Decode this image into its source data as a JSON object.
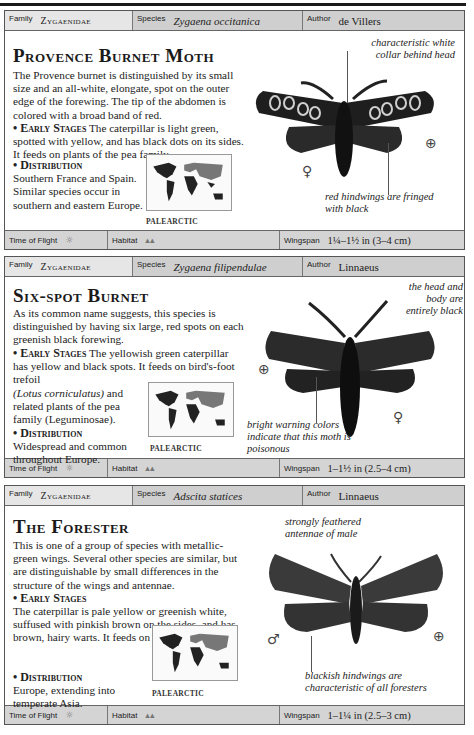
{
  "entries": [
    {
      "family_label": "Family",
      "family": "Zygaenidae",
      "species_label": "Species",
      "species": "Zygaena occitanica",
      "author_label": "Author",
      "author": "de Villers",
      "title": "Provence Burnet Moth",
      "description": "The Provence burnet is distinguished by its small size and an all-white, elongate, spot on the outer edge of the forewing. The tip of the abdomen is colored with a broad band of red.",
      "early_stages_heading": "• Early Stages",
      "early_stages": "The caterpillar is light green, spotted with yellow, and has black dots on its sides. It feeds on plants of the pea family.",
      "distribution_heading": "• Distribution",
      "distribution": "Southern France and Spain. Similar species occur in southern and eastern Europe.",
      "map_label": "PALEARCTIC",
      "annotation_1": "characteristic white collar behind head",
      "annotation_2": "red hindwings are fringed with black",
      "sex_symbol": "♀",
      "magnify_icon": "magnify-icon",
      "time_label": "Time of Flight",
      "time_icon": "☼",
      "habitat_label": "Habitat",
      "habitat_icon": "ᨓᨓ",
      "wingspan_label": "Wingspan",
      "wingspan": "1¼–1½ in (3–4 cm)"
    },
    {
      "family_label": "Family",
      "family": "Zygaenidae",
      "species_label": "Species",
      "species": "Zygaena filipendulae",
      "author_label": "Author",
      "author": "Linnaeus",
      "title": "Six-spot Burnet",
      "description": "As its common name suggests, this species is distinguished by having six large, red spots on each greenish black forewing.",
      "early_stages_heading": "• Early Stages",
      "early_stages_a": "The yellowish green caterpillar has yellow and black spots. It feeds on bird's-foot trefoil",
      "early_stages_italic": "(Lotus corniculatus)",
      "early_stages_b": "and related plants of the pea family (Leguminosae).",
      "distribution_heading": "• Distribution",
      "distribution": "Widespread and common throughout Europe.",
      "map_label": "PALEARCTIC",
      "annotation_1": "the head and body are entirely black",
      "annotation_2": "bright warning colors indicate that this moth is poisonous",
      "sex_symbol": "♀",
      "time_label": "Time of Flight",
      "time_icon": "☼",
      "habitat_label": "Habitat",
      "habitat_icon": "ᨓᨓ",
      "wingspan_label": "Wingspan",
      "wingspan": "1–1½ in (2.5–4 cm)"
    },
    {
      "family_label": "Family",
      "family": "Zygaenidae",
      "species_label": "Species",
      "species": "Adscita statices",
      "author_label": "Author",
      "author": "Linnaeus",
      "title": "The Forester",
      "description": "This is one of a group of species with metallic-green wings. Several other species are similar, but are distinguishable by small differences in the structure of the wings and antennae.",
      "early_stages_heading": "• Early Stages",
      "early_stages_a": "The caterpillar is pale yellow or greenish white, suffused with pinkish brown on the sides, and has brown, hairy warts. It feeds on sorrel",
      "early_stages_italic": "(Rumex).",
      "distribution_heading": "• Distribution",
      "distribution": "Europe, extending into temperate Asia.",
      "map_label": "PALEARCTIC",
      "annotation_1": "strongly feathered antennae of male",
      "annotation_2": "blackish hindwings are characteristic of all foresters",
      "sex_symbol": "♂",
      "time_label": "Time of Flight",
      "time_icon": "☼",
      "habitat_label": "Habitat",
      "habitat_icon": "ᨓᨓ",
      "wingspan_label": "Wingspan",
      "wingspan": "1–1¼ in (2.5–3 cm)"
    }
  ]
}
